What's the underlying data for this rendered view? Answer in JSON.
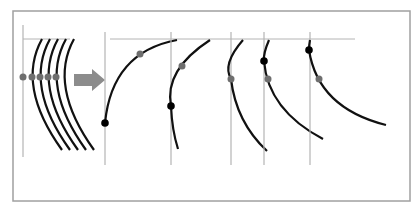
{
  "diagram": {
    "width": 419,
    "height": 208,
    "colors": {
      "background": "#ffffff",
      "frame": "#a0a0a0",
      "guide": "#b4b4b4",
      "curve": "#111111",
      "dot_gray": "#6e6e6e",
      "dot_black": "#000000",
      "arrow": "#8c8c8c"
    },
    "frame": {
      "x": 13,
      "y": 11,
      "w": 397,
      "h": 190
    },
    "left_group": {
      "description": "five parallel concave arcs with gray dots on a shared horizontal level",
      "vertical_guide": {
        "x": 23,
        "y1": 25,
        "y2": 157
      },
      "horizontal_guide": {
        "x1": 23,
        "x2": 70,
        "y": 39
      },
      "curves": [
        {
          "d": "M42,39 Q16,86 62,150"
        },
        {
          "d": "M50,39 Q24,86 70,150"
        },
        {
          "d": "M58,39 Q32,86 78,150"
        },
        {
          "d": "M66,39 Q40,86 86,150"
        },
        {
          "d": "M74,39 Q48,86 94,150"
        }
      ],
      "gray_dots": [
        {
          "cx": 23,
          "cy": 77
        },
        {
          "cx": 32,
          "cy": 77
        },
        {
          "cx": 40,
          "cy": 77
        },
        {
          "cx": 48,
          "cy": 77
        },
        {
          "cx": 56,
          "cy": 77
        }
      ]
    },
    "arrow": {
      "icon": "right-arrow-icon",
      "points": "74,74 92,74 92,69 105,80 92,91 92,86 74,86"
    },
    "horizontal_guide": {
      "x1": 110,
      "x2": 355,
      "y": 39
    },
    "panels": [
      {
        "name": "panel-1",
        "vertical_guide": {
          "x": 105,
          "y1": 32,
          "y2": 165
        },
        "curve": "M105,123 Q112,52 177,40",
        "gray_dot": {
          "cx": 140,
          "cy": 54
        },
        "black_dot": {
          "cx": 105,
          "cy": 123
        }
      },
      {
        "name": "panel-2",
        "vertical_guide": {
          "x": 171,
          "y1": 32,
          "y2": 165
        },
        "curve": "M210,40 Q164,70 171,106 Q172,130 178,149",
        "gray_dot": {
          "cx": 182,
          "cy": 66
        },
        "black_dot": {
          "cx": 171,
          "cy": 106
        }
      },
      {
        "name": "panel-3",
        "vertical_guide": {
          "x": 231,
          "y1": 32,
          "y2": 165
        },
        "curve": "M243,40 Q222,64 231,79 Q236,122 267,151",
        "gray_dot": {
          "cx": 231,
          "cy": 79
        },
        "black_dot": null
      },
      {
        "name": "panel-4",
        "vertical_guide": {
          "x": 264,
          "y1": 32,
          "y2": 165
        },
        "curve": "M269,40 Q263,54 264,61 Q268,110 323,139",
        "gray_dot": {
          "cx": 268,
          "cy": 79
        },
        "black_dot": {
          "cx": 264,
          "cy": 61
        }
      },
      {
        "name": "panel-5",
        "vertical_guide": {
          "x": 310,
          "y1": 32,
          "y2": 165
        },
        "curve": "M310,40 Q309,45 309,50 Q318,108 386,125",
        "gray_dot": {
          "cx": 319,
          "cy": 79
        },
        "black_dot": {
          "cx": 309,
          "cy": 50
        }
      }
    ]
  }
}
